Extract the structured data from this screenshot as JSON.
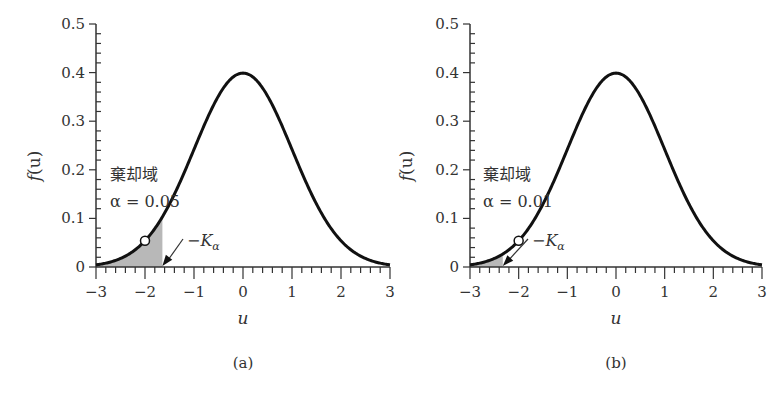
{
  "chart_data": [
    {
      "id": "a",
      "type": "line",
      "title": "",
      "sub_label": "(a)",
      "xlabel": "u",
      "ylabel": "f(u)",
      "xlim": [
        -3,
        3
      ],
      "ylim": [
        0,
        0.5
      ],
      "x_ticks": [
        -3,
        -2,
        -1,
        0,
        1,
        2,
        3
      ],
      "x_tick_labels": [
        "−3",
        "−2",
        "−1",
        "0",
        "1",
        "2",
        "3"
      ],
      "y_ticks": [
        0,
        0.1,
        0.2,
        0.3,
        0.4,
        0.5
      ],
      "y_tick_labels": [
        "0",
        "0.1",
        "0.2",
        "0.3",
        "0.4",
        "0.5"
      ],
      "grid": false,
      "series": [
        {
          "name": "standard normal pdf",
          "function": "exp(-u^2/2)/sqrt(2*pi)",
          "x": [
            -3,
            -2.5,
            -2,
            -1.645,
            -1.5,
            -1,
            -0.5,
            0,
            0.5,
            1,
            1.5,
            2,
            2.5,
            3
          ],
          "values": [
            0.0044,
            0.0175,
            0.054,
            0.103,
            0.1295,
            0.242,
            0.352,
            0.399,
            0.352,
            0.242,
            0.1295,
            0.054,
            0.0175,
            0.0044
          ]
        }
      ],
      "shaded_region": {
        "from": -3,
        "to": -1.645,
        "label": "棄却域",
        "alpha_label": "α = 0.05"
      },
      "marker": {
        "x": -2,
        "y": 0.054,
        "style": "open-circle"
      },
      "annotations": [
        {
          "text": "棄却域",
          "meaning": "rejection region"
        },
        {
          "text": "α = 0.05"
        },
        {
          "text": "−Kα",
          "points_to_x": -1.645
        }
      ]
    },
    {
      "id": "b",
      "type": "line",
      "title": "",
      "sub_label": "(b)",
      "xlabel": "u",
      "ylabel": "f(u)",
      "xlim": [
        -3,
        3
      ],
      "ylim": [
        0,
        0.5
      ],
      "x_ticks": [
        -3,
        -2,
        -1,
        0,
        1,
        2,
        3
      ],
      "x_tick_labels": [
        "−3",
        "−2",
        "−1",
        "0",
        "1",
        "2",
        "3"
      ],
      "y_ticks": [
        0,
        0.1,
        0.2,
        0.3,
        0.4,
        0.5
      ],
      "y_tick_labels": [
        "0",
        "0.1",
        "0.2",
        "0.3",
        "0.4",
        "0.5"
      ],
      "grid": false,
      "series": [
        {
          "name": "standard normal pdf",
          "function": "exp(-u^2/2)/sqrt(2*pi)",
          "x": [
            -3,
            -2.5,
            -2.326,
            -2,
            -1.5,
            -1,
            -0.5,
            0,
            0.5,
            1,
            1.5,
            2,
            2.5,
            3
          ],
          "values": [
            0.0044,
            0.0175,
            0.0267,
            0.054,
            0.1295,
            0.242,
            0.352,
            0.399,
            0.352,
            0.242,
            0.1295,
            0.054,
            0.0175,
            0.0044
          ]
        }
      ],
      "shaded_region": {
        "from": -3,
        "to": -2.326,
        "label": "棄却域",
        "alpha_label": "α = 0.01"
      },
      "marker": {
        "x": -2,
        "y": 0.054,
        "style": "open-circle"
      },
      "annotations": [
        {
          "text": "棄却域",
          "meaning": "rejection region"
        },
        {
          "text": "α = 0.01"
        },
        {
          "text": "−Kα",
          "points_to_x": -2.326
        }
      ]
    }
  ],
  "labels": {
    "a": {
      "region": "棄却域",
      "alpha": "α = 0.05",
      "k": "−K",
      "k_sub": "α",
      "sub": "(a)",
      "ylabel_f": "f",
      "ylabel_rest": "(u)",
      "xlabel": "u"
    },
    "b": {
      "region": "棄却域",
      "alpha": "α = 0.01",
      "k": "−K",
      "k_sub": "α",
      "sub": "(b)",
      "ylabel_f": "f",
      "ylabel_rest": "(u)",
      "xlabel": "u"
    }
  },
  "colors": {
    "curve": "#111111",
    "shade": "#b8b8b8",
    "axis": "#333333"
  }
}
